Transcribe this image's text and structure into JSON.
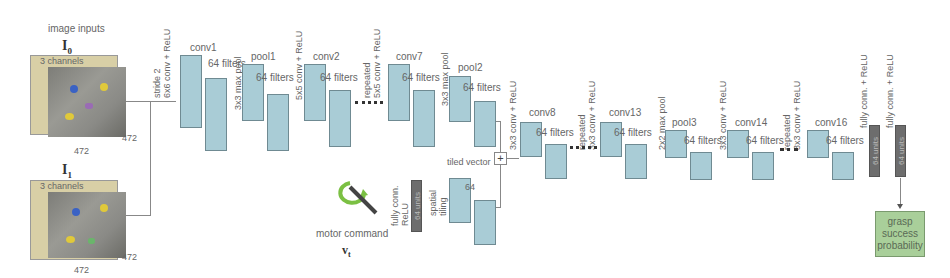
{
  "inputs": {
    "title": "image inputs",
    "i0": {
      "label": "I",
      "sub": "0",
      "channels": "3 channels",
      "width": "472",
      "height": "472"
    },
    "i1": {
      "label": "I",
      "sub": "1",
      "channels": "3 channels",
      "width": "472",
      "height": "472"
    }
  },
  "ops": {
    "op1": "stride 2",
    "op1b": "6x6 conv + ReLU",
    "op2": "3x3 max pool",
    "op3": "5x5 conv + ReLU",
    "op4a": "repeated",
    "op4b": "5x5 conv + ReLU",
    "op5": "3x3 max pool",
    "op6": "3x3 conv + ReLU",
    "op7a": "repeated",
    "op7b": "3x3 conv + ReLU",
    "op8": "2x2 max pool",
    "op9": "3x3 conv + ReLU",
    "op10a": "repeated",
    "op10b": "3x3 conv + ReLU",
    "op11": "fully conn. + ReLU",
    "op12": "fully conn. + ReLU",
    "mop1a": "fully conn.",
    "mop1b": "ReLU",
    "mop2a": "spatial",
    "mop2b": "tiling"
  },
  "layers": [
    {
      "name": "conv1",
      "filters": "64 filters"
    },
    {
      "name": "pool1",
      "filters": "64 filters"
    },
    {
      "name": "conv2",
      "filters": "64 filters"
    },
    {
      "name": "conv7",
      "filters": "64 filters"
    },
    {
      "name": "pool2",
      "filters": "64 filters"
    },
    {
      "name": "conv8",
      "filters": "64 filters"
    },
    {
      "name": "conv13",
      "filters": "64 filters"
    },
    {
      "name": "pool3",
      "filters": "64 filters"
    },
    {
      "name": "conv14",
      "filters": "64 filters"
    },
    {
      "name": "conv16",
      "filters": "64 filters"
    }
  ],
  "motor": {
    "label": "motor command",
    "var": "v",
    "var_sub": "t",
    "fc_units": "64 units",
    "tiled_title": "tiled vector",
    "tiled_filters": "64"
  },
  "fc": {
    "fc1": "64 units",
    "fc2": "64 units"
  },
  "output": {
    "line1": "grasp",
    "line2": "success",
    "line3": "probability"
  },
  "merge": {
    "symbol": "+"
  },
  "colors": {
    "slab": "#a9ccd6",
    "fc": "#6d6d6d",
    "output": "#a9cf9a",
    "input_bg": "#d8cfa6"
  }
}
